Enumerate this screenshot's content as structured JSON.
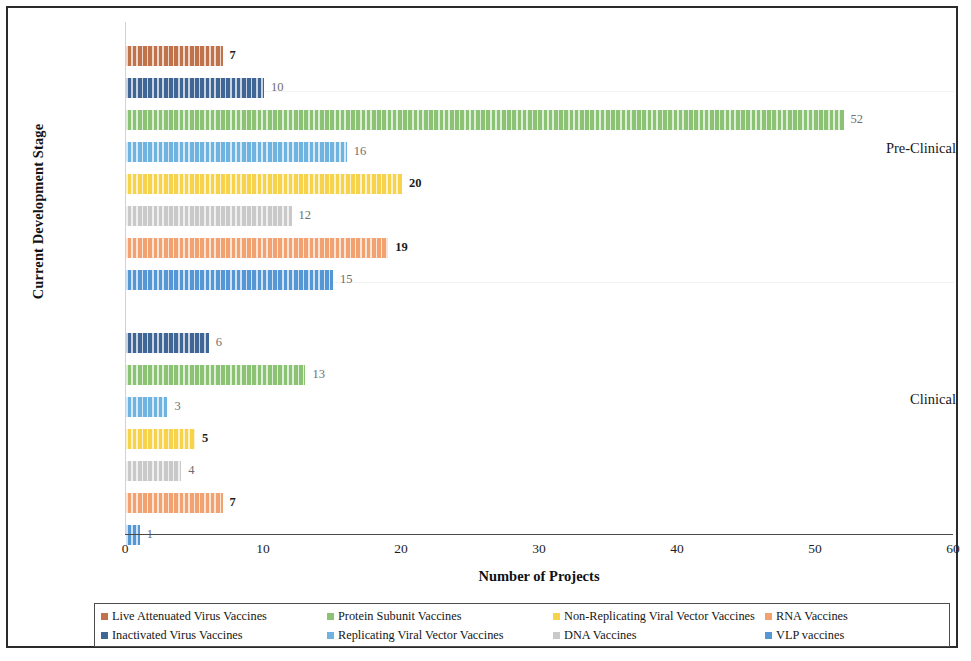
{
  "figure": {
    "y_axis_title": "Current Development Stage",
    "x_axis_title": "Number of Projects"
  },
  "axis": {
    "x_ticks": [
      "0",
      "10",
      "20",
      "30",
      "40",
      "50",
      "60"
    ],
    "y_categories": [
      "Pre-Clinical",
      "Clinical"
    ]
  },
  "legend": {
    "items": [
      {
        "label": "Live Attenuated Virus Vaccines",
        "color": "#c0724a"
      },
      {
        "label": "Inactivated Virus Vaccines",
        "color": "#3f6694"
      },
      {
        "label": "Protein Subunit Vaccines",
        "color": "#8cc273"
      },
      {
        "label": "Replicating Viral Vector Vaccines",
        "color": "#6fb3e0"
      },
      {
        "label": "Non-Replicating Viral Vector Vaccines",
        "color": "#f6d34a"
      },
      {
        "label": "DNA Vaccines",
        "color": "#c9c9c9"
      },
      {
        "label": "RNA Vaccines",
        "color": "#f2a270"
      },
      {
        "label": "VLP vaccines",
        "color": "#5596d4"
      }
    ]
  },
  "chart_data": {
    "type": "bar",
    "orientation": "horizontal",
    "title": "",
    "xlabel": "Number of Projects",
    "ylabel": "Current Development Stage",
    "xlim": [
      0,
      60
    ],
    "xticks": [
      0,
      10,
      20,
      30,
      40,
      50,
      60
    ],
    "grid": false,
    "legend_position": "bottom",
    "categories": [
      "Pre-Clinical",
      "Clinical"
    ],
    "series": [
      {
        "name": "Live Attenuated Virus Vaccines",
        "color": "#c0724a",
        "values": [
          7,
          null
        ]
      },
      {
        "name": "Inactivated Virus Vaccines",
        "color": "#3f6694",
        "values": [
          10,
          6
        ]
      },
      {
        "name": "Protein Subunit Vaccines",
        "color": "#8cc273",
        "values": [
          52,
          13
        ]
      },
      {
        "name": "Replicating Viral Vector Vaccines",
        "color": "#6fb3e0",
        "values": [
          16,
          3
        ]
      },
      {
        "name": "Non-Replicating Viral Vector Vaccines",
        "color": "#f6d34a",
        "values": [
          20,
          5
        ]
      },
      {
        "name": "DNA Vaccines",
        "color": "#c9c9c9",
        "values": [
          12,
          4
        ]
      },
      {
        "name": "RNA Vaccines",
        "color": "#f2a270",
        "values": [
          19,
          7
        ]
      },
      {
        "name": "VLP vaccines",
        "color": "#5596d4",
        "values": [
          15,
          1
        ]
      }
    ],
    "bars": [
      {
        "group": "Pre-Clinical",
        "series": "Live Attenuated Virus Vaccines",
        "value": 7,
        "label": "7",
        "color": "#c0724a",
        "emphasis": true
      },
      {
        "group": "Pre-Clinical",
        "series": "Inactivated Virus Vaccines",
        "value": 10,
        "label": "10",
        "color": "#3f6694",
        "emphasis": false
      },
      {
        "group": "Pre-Clinical",
        "series": "Protein Subunit Vaccines",
        "value": 52,
        "label": "52",
        "color": "#8cc273",
        "emphasis": false
      },
      {
        "group": "Pre-Clinical",
        "series": "Replicating Viral Vector Vaccines",
        "value": 16,
        "label": "16",
        "color": "#6fb3e0",
        "emphasis": false
      },
      {
        "group": "Pre-Clinical",
        "series": "Non-Replicating Viral Vector Vaccines",
        "value": 20,
        "label": "20",
        "color": "#f6d34a",
        "emphasis": true
      },
      {
        "group": "Pre-Clinical",
        "series": "DNA Vaccines",
        "value": 12,
        "label": "12",
        "color": "#c9c9c9",
        "emphasis": false
      },
      {
        "group": "Pre-Clinical",
        "series": "RNA Vaccines",
        "value": 19,
        "label": "19",
        "color": "#f2a270",
        "emphasis": true
      },
      {
        "group": "Pre-Clinical",
        "series": "VLP vaccines",
        "value": 15,
        "label": "15",
        "color": "#5596d4",
        "emphasis": false
      },
      {
        "group": "Clinical",
        "series": "Inactivated Virus Vaccines",
        "value": 6,
        "label": "6",
        "color": "#3f6694",
        "emphasis": false
      },
      {
        "group": "Clinical",
        "series": "Protein Subunit Vaccines",
        "value": 13,
        "label": "13",
        "color": "#8cc273",
        "emphasis": false
      },
      {
        "group": "Clinical",
        "series": "Replicating Viral Vector Vaccines",
        "value": 3,
        "label": "3",
        "color": "#6fb3e0",
        "emphasis": false
      },
      {
        "group": "Clinical",
        "series": "Non-Replicating Viral Vector Vaccines",
        "value": 5,
        "label": "5",
        "color": "#f6d34a",
        "emphasis": true
      },
      {
        "group": "Clinical",
        "series": "DNA Vaccines",
        "value": 4,
        "label": "4",
        "color": "#c9c9c9",
        "emphasis": false
      },
      {
        "group": "Clinical",
        "series": "RNA Vaccines",
        "value": 7,
        "label": "7",
        "color": "#f2a270",
        "emphasis": true
      },
      {
        "group": "Clinical",
        "series": "VLP vaccines",
        "value": 1,
        "label": "1",
        "color": "#5596d4",
        "emphasis": false
      }
    ]
  }
}
